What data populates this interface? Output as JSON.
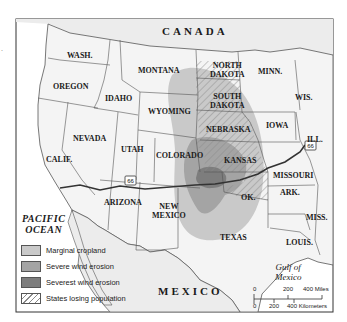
{
  "map": {
    "title": "Dust Bowl map",
    "countries": {
      "canada": "CANADA",
      "mexico": "MEXICO"
    },
    "water": {
      "pacific_line1": "PACIFIC",
      "pacific_line2": "OCEAN",
      "gulf_line1": "Gulf of",
      "gulf_line2": "Mexico"
    },
    "states": {
      "wash": "WASH.",
      "oregon": "OREGON",
      "idaho": "IDAHO",
      "montana": "MONTANA",
      "wyoming": "WYOMING",
      "nevada": "NEVADA",
      "calif": "CALIF.",
      "utah": "UTAH",
      "colorado": "COLORADO",
      "arizona": "ARIZONA",
      "new_mexico_1": "NEW",
      "new_mexico_2": "MEXICO",
      "north_dakota_1": "NORTH",
      "north_dakota_2": "DAKOTA",
      "south_dakota_1": "SOUTH",
      "south_dakota_2": "DAKOTA",
      "nebraska": "NEBRASKA",
      "kansas": "KANSAS",
      "ok": "OK.",
      "texas": "TEXAS",
      "minn": "MINN.",
      "wis": "WIS.",
      "iowa": "IOWA",
      "ill": "ILL.",
      "missouri": "MISSOURI",
      "ark": "ARK.",
      "miss": "MISS.",
      "louis": "LOUIS."
    },
    "route_shield": "66",
    "colors": {
      "land": "#f4f4f4",
      "water": "#ffffff",
      "border": "#555555",
      "marginal_cropland": "#c9c9c9",
      "severe_wind_erosion": "#a4a4a4",
      "severest_wind_erosion": "#7d7d7d",
      "hatch": "#8a8a8a",
      "route": "#333333"
    }
  },
  "legend": {
    "items": [
      {
        "label": "Marginal cropland",
        "key": "marginal_cropland"
      },
      {
        "label": "Severe wind erosion",
        "key": "severe_wind_erosion"
      },
      {
        "label": "Severest wind erosion",
        "key": "severest_wind_erosion"
      },
      {
        "label": "States losing population",
        "key": "states_losing_population"
      }
    ]
  },
  "scale": {
    "miles": [
      "0",
      "200",
      "400 Miles"
    ],
    "kilometers": [
      "0",
      "200",
      "400 Kilometers"
    ]
  }
}
